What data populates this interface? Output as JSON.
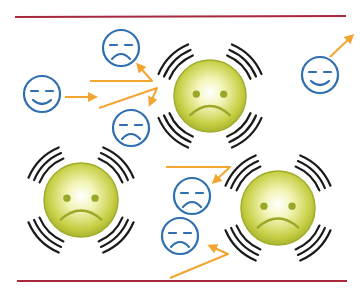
{
  "colors": {
    "background": "#ffffff",
    "rule": "#a8283c",
    "big_face_fill_center": "#f6f7c8",
    "big_face_fill_edge": "#b9c33a",
    "big_face_stroke": "#9fae2a",
    "big_face_feature": "#98a829",
    "arc": "#1a1a1a",
    "small_face": "#2f6fb0",
    "arrow": "#f2a531"
  },
  "rules": [
    {
      "name": "top-rule",
      "x1": 15,
      "y1": 17,
      "x2": 346,
      "y2": 16
    },
    {
      "name": "bottom-rule",
      "x1": 17,
      "y1": 281,
      "x2": 347,
      "y2": 281
    }
  ],
  "big_faces": [
    {
      "name": "stressed-face-center",
      "cx": 210,
      "cy": 96,
      "r": 36,
      "mood": "sad"
    },
    {
      "name": "stressed-face-left",
      "cx": 81,
      "cy": 200,
      "r": 37,
      "mood": "sad"
    },
    {
      "name": "stressed-face-right",
      "cx": 278,
      "cy": 208,
      "r": 37,
      "mood": "sad"
    }
  ],
  "small_faces": [
    {
      "name": "calm-face-left",
      "cx": 42,
      "cy": 94,
      "r": 18,
      "mood": "smile"
    },
    {
      "name": "upset-face-top",
      "cx": 121,
      "cy": 48,
      "r": 18,
      "mood": "frown"
    },
    {
      "name": "upset-face-middle",
      "cx": 131,
      "cy": 128,
      "r": 18,
      "mood": "frown"
    },
    {
      "name": "calm-face-right",
      "cx": 320,
      "cy": 75,
      "r": 18,
      "mood": "smile"
    },
    {
      "name": "upset-face-lower-1",
      "cx": 192,
      "cy": 196,
      "r": 18,
      "mood": "frown"
    },
    {
      "name": "upset-face-lower-2",
      "cx": 180,
      "cy": 236,
      "r": 18,
      "mood": "frown"
    }
  ],
  "arrows": [
    {
      "name": "arrow-calm-to-right",
      "x1": 65,
      "y1": 97,
      "x2": 95,
      "y2": 97
    },
    {
      "name": "arrow-to-upset-top",
      "points": [
        [
          90,
          81
        ],
        [
          152,
          81
        ],
        [
          138,
          65
        ]
      ]
    },
    {
      "name": "arrow-to-upset-middle",
      "points": [
        [
          99,
          108
        ],
        [
          157,
          88
        ],
        [
          150,
          104
        ]
      ]
    },
    {
      "name": "arrow-calm-right-up",
      "x1": 330,
      "y1": 57,
      "x2": 352,
      "y2": 36
    },
    {
      "name": "arrow-to-upset-lower-1",
      "points": [
        [
          166,
          167
        ],
        [
          230,
          167
        ],
        [
          214,
          182
        ]
      ]
    },
    {
      "name": "arrow-to-upset-lower-2",
      "points": [
        [
          170,
          278
        ],
        [
          228,
          254
        ],
        [
          210,
          246
        ]
      ]
    }
  ]
}
